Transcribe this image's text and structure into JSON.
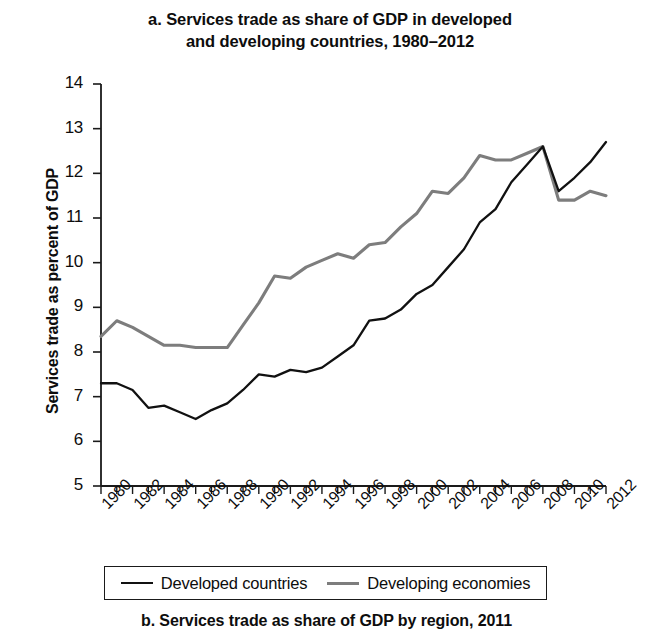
{
  "figure": {
    "panel_a_title_line1": "a. Services trade as share of GDP in developed",
    "panel_a_title_line2": "and developing countries, 1980–2012",
    "panel_b_caption": "b. Services trade as share of GDP by region, 2011"
  },
  "legend": {
    "items": [
      {
        "label": "Developed countries",
        "color": "#111111",
        "style": "solid-black"
      },
      {
        "label": "Developing economies",
        "color": "#7d7d7d",
        "style": "solid-gray"
      }
    ]
  },
  "axes": {
    "y_title": "Services trade as percent of GDP",
    "y_ticks": [
      "14",
      "13",
      "12",
      "11",
      "10",
      "9",
      "8",
      "7",
      "6",
      "5"
    ],
    "x_ticks": [
      "1980",
      "1982",
      "1984",
      "1986",
      "1988",
      "1990",
      "1992",
      "1994",
      "1996",
      "1998",
      "2000",
      "2002",
      "2004",
      "2006",
      "2008",
      "2010",
      "2012"
    ]
  },
  "chart_data": {
    "type": "line",
    "title": "a. Services trade as share of GDP in developed and developing countries, 1980–2012",
    "xlabel": "",
    "ylabel": "Services trade as percent of GDP",
    "ylim": [
      5,
      14
    ],
    "xlim": [
      1980,
      2012
    ],
    "grid": false,
    "legend_position": "bottom",
    "x": [
      1980,
      1981,
      1982,
      1983,
      1984,
      1985,
      1986,
      1987,
      1988,
      1989,
      1990,
      1991,
      1992,
      1993,
      1994,
      1995,
      1996,
      1997,
      1998,
      1999,
      2000,
      2001,
      2002,
      2003,
      2004,
      2005,
      2006,
      2007,
      2008,
      2009,
      2010,
      2011,
      2012
    ],
    "series": [
      {
        "name": "Developed countries",
        "color": "#111111",
        "values": [
          7.3,
          7.3,
          7.15,
          6.75,
          6.8,
          6.65,
          6.5,
          6.7,
          6.85,
          7.15,
          7.5,
          7.45,
          7.6,
          7.55,
          7.65,
          7.9,
          8.15,
          8.7,
          8.75,
          8.95,
          9.3,
          9.5,
          9.9,
          10.3,
          10.9,
          11.2,
          11.8,
          12.2,
          12.6,
          11.6,
          11.9,
          12.25,
          12.7
        ]
      },
      {
        "name": "Developing economies",
        "color": "#7d7d7d",
        "values": [
          8.35,
          8.7,
          8.55,
          8.35,
          8.15,
          8.15,
          8.1,
          8.1,
          8.1,
          8.6,
          9.1,
          9.7,
          9.65,
          9.9,
          10.05,
          10.2,
          10.1,
          10.4,
          10.45,
          10.8,
          11.1,
          11.6,
          11.55,
          11.9,
          12.4,
          12.3,
          12.3,
          12.45,
          12.6,
          11.4,
          11.4,
          11.6,
          11.5
        ]
      }
    ]
  }
}
